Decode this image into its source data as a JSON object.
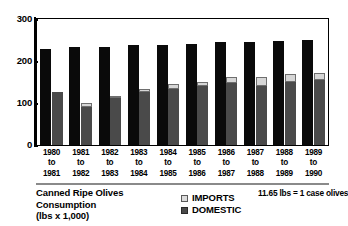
{
  "chart_data": {
    "type": "bar",
    "title": "Canned Ripe Olives Consumption",
    "subtitle": "(lbs  x 1,000)",
    "xlabel": "",
    "ylabel": "",
    "ylim": [
      0,
      300
    ],
    "yticks": [
      0,
      100,
      200,
      300
    ],
    "ytick_labels": [
      "0",
      "100",
      "200",
      "300"
    ],
    "grid": false,
    "legend_position": "bottom-center",
    "annotation": "11.65 lbs = 1 case olives",
    "categories": [
      "1980\nto\n1981",
      "1981\nto\n1982",
      "1982\nto\n1983",
      "1983\nto\n1984",
      "1984\nto\n1985",
      "1985\nto\n1986",
      "1986\nto\n1987",
      "1987\nto\n1988",
      "1988\nto\n1989",
      "1989\nto\n1990"
    ],
    "category_lines": [
      [
        "1980",
        "to",
        "1981"
      ],
      [
        "1981",
        "to",
        "1982"
      ],
      [
        "1982",
        "to",
        "1983"
      ],
      [
        "1983",
        "to",
        "1984"
      ],
      [
        "1984",
        "to",
        "1985"
      ],
      [
        "1985",
        "to",
        "1986"
      ],
      [
        "1986",
        "to",
        "1987"
      ],
      [
        "1987",
        "to",
        "1988"
      ],
      [
        "1988",
        "to",
        "1989"
      ],
      [
        "1989",
        "to",
        "1990"
      ]
    ],
    "series": [
      {
        "name": "TOTAL",
        "color": "#0a0a0a",
        "values": [
          228,
          234,
          234,
          238,
          238,
          240,
          245,
          245,
          248,
          250
        ]
      },
      {
        "name": "DOMESTIC",
        "color": "#4a4a4a",
        "values": [
          126,
          90,
          112,
          126,
          133,
          140,
          148,
          140,
          150,
          155
        ]
      },
      {
        "name": "IMPORTS",
        "color": "#d6d6d6",
        "values": [
          0,
          10,
          5,
          7,
          12,
          10,
          14,
          22,
          19,
          16
        ]
      }
    ],
    "stacked_totals": [
      126,
      100,
      117,
      133,
      145,
      150,
      162,
      162,
      169,
      171
    ]
  },
  "legend": {
    "items": [
      {
        "label": "IMPORTS",
        "swatch": "imports-swatch"
      },
      {
        "label": "DOMESTIC",
        "swatch": "domestic-swatch"
      }
    ]
  },
  "footer": {
    "title_line1": "Canned Ripe Olives",
    "title_line2": "Consumption",
    "title_line3": "(lbs  x 1,000)",
    "note": "11.65 lbs = 1 case olives"
  }
}
